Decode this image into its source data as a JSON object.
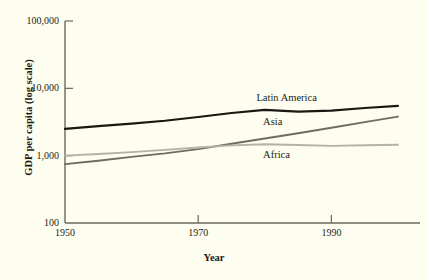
{
  "chart_data": {
    "type": "line",
    "title": "",
    "xlabel": "Year",
    "ylabel": "GDP per capita (log scale)",
    "yscale": "log",
    "ylim": [
      100,
      100000
    ],
    "xlim": [
      1950,
      2000
    ],
    "grid": false,
    "legend_position": "inline-annotations",
    "background_color": "#fdfdf0",
    "axis_color": "#6b6a55",
    "xticks": [
      1950,
      1970,
      1990
    ],
    "xtick_labels": [
      "1950",
      "1970",
      "1990"
    ],
    "yticks": [
      100,
      1000,
      10000,
      100000
    ],
    "ytick_labels": [
      "100",
      "1,000",
      "10,000",
      "100,000"
    ],
    "x": [
      1950,
      1955,
      1960,
      1965,
      1970,
      1975,
      1980,
      1985,
      1990,
      1995,
      2000
    ],
    "series": [
      {
        "name": "Latin America",
        "color": "#1a1710",
        "width": 2.2,
        "values": [
          2500,
          2750,
          3000,
          3300,
          3750,
          4300,
          4800,
          4500,
          4650,
          5100,
          5500
        ]
      },
      {
        "name": "Asia",
        "color": "#6e6d5c",
        "width": 1.9,
        "values": [
          750,
          840,
          960,
          1080,
          1250,
          1500,
          1800,
          2150,
          2600,
          3150,
          3800
        ]
      },
      {
        "name": "Africa",
        "color": "#b3b3a0",
        "width": 1.9,
        "values": [
          1000,
          1060,
          1130,
          1220,
          1320,
          1420,
          1480,
          1440,
          1400,
          1430,
          1450
        ]
      }
    ],
    "annotations": [
      {
        "text": "Latin America",
        "x": 1984,
        "y": 6900
      },
      {
        "text": "Asia",
        "x": 1985,
        "y": 3100
      },
      {
        "text": "Africa",
        "x": 1985,
        "y": 1000
      }
    ]
  }
}
